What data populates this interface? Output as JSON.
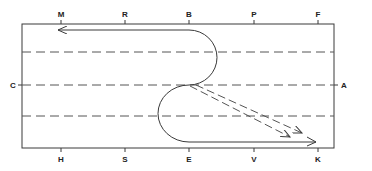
{
  "diagram": {
    "type": "dressage-arena-figure",
    "colors": {
      "line": "#3a3a3a",
      "dash": "#555555",
      "background": "#ffffff"
    },
    "markers": {
      "top": [
        {
          "letter": "M",
          "x": 61
        },
        {
          "letter": "R",
          "x": 125
        },
        {
          "letter": "B",
          "x": 189
        },
        {
          "letter": "P",
          "x": 254
        },
        {
          "letter": "F",
          "x": 318
        }
      ],
      "bottom": [
        {
          "letter": "H",
          "x": 61
        },
        {
          "letter": "S",
          "x": 125
        },
        {
          "letter": "E",
          "x": 189
        },
        {
          "letter": "V",
          "x": 254
        },
        {
          "letter": "K",
          "x": 318
        }
      ],
      "left": {
        "letter": "C"
      },
      "right": {
        "letter": "A"
      }
    },
    "dashed_lines": 3,
    "paths": [
      {
        "name": "solid-serpentine-track",
        "style": "solid",
        "description": "From near K along the track, half-circle loops through centerline, ending with arrow toward M"
      },
      {
        "name": "dashed-diagonal-1",
        "style": "dashed",
        "description": "Diagonal from centerline toward K"
      },
      {
        "name": "dashed-diagonal-2",
        "style": "dashed",
        "description": "Diagonal from centerline toward K"
      }
    ]
  }
}
